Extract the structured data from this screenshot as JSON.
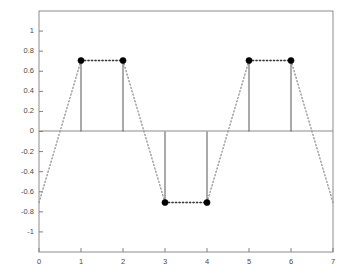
{
  "figure": {
    "background_color": "#ffffff",
    "axes_color": "#808080",
    "stem_color": "#555555",
    "marker_color": "#000000",
    "dotted_color": "#999999",
    "tick_label_color": "#4a4a4a"
  },
  "chart_data": {
    "type": "line",
    "title": "",
    "xlabel": "",
    "ylabel": "",
    "xlim": [
      0,
      7
    ],
    "ylim": [
      -1.2,
      1.2
    ],
    "grid": false,
    "legend": null,
    "xticks": [
      0,
      1,
      2,
      3,
      4,
      5,
      6,
      7
    ],
    "xtick_labels": [
      "0",
      "1",
      "2",
      "3",
      "4",
      "5",
      "6",
      "7"
    ],
    "yticks": [
      1,
      0.8,
      0.6,
      0.4,
      0.2,
      0,
      -0.2,
      -0.4,
      -0.6,
      -0.8,
      -1
    ],
    "ytick_labels": [
      "1",
      "0.8",
      "0.6",
      "0.4",
      "0.2",
      "0",
      "-0.2",
      "-0.4",
      "-0.6",
      "-0.8",
      "-1"
    ],
    "series": [
      {
        "name": "samples",
        "style": "stem",
        "marker": "filled-circle",
        "x": [
          1,
          2,
          3,
          4,
          5,
          6
        ],
        "values": [
          0.707,
          0.707,
          -0.707,
          -0.707,
          0.707,
          0.707
        ]
      },
      {
        "name": "continuous-envelope",
        "style": "dotted",
        "x": [
          0,
          1,
          2,
          3,
          4,
          5,
          6,
          7
        ],
        "values": [
          -0.707,
          0.707,
          0.707,
          -0.707,
          -0.707,
          0.707,
          0.707,
          -0.707
        ]
      }
    ]
  }
}
